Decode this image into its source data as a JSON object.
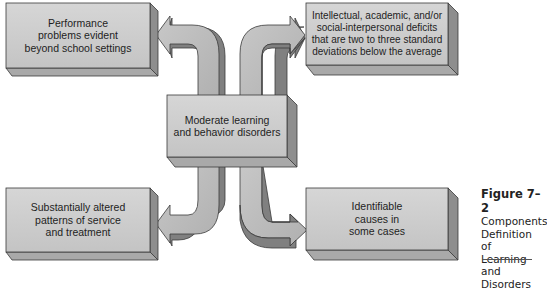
{
  "diagram": {
    "type": "concept-map",
    "center": {
      "label": "Moderate learning\nand behavior disorders"
    },
    "components": [
      {
        "position": "top-left",
        "label": "Performance\nproblems evident\nbeyond school settings"
      },
      {
        "position": "top-right",
        "label": "Intellectual, academic, and/or\nsocial-interpersonal deficits\nthat are two to three standard\ndeviations below the average"
      },
      {
        "position": "bottom-left",
        "label": "Substantially altered\npatterns of service\nand treatment"
      },
      {
        "position": "bottom-right",
        "label": "Identifiable\ncauses in\nsome cases"
      }
    ],
    "colors": {
      "box_face": "#cfcfcf",
      "box_side": "#8e8e8e",
      "box_bottom": "#a9a9a9",
      "arrow_face": "#bdbdbd",
      "arrow_shadow": "#808080",
      "outline": "#3a3a3a"
    }
  },
  "caption": {
    "figure_label": "Figure 7–2",
    "text": "Components\nDefinition of\nLearning and\nDisorders"
  }
}
